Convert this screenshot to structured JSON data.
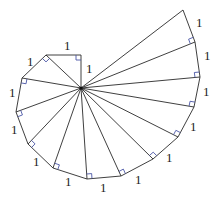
{
  "diagram": {
    "center": [
      81,
      88
    ],
    "vertices": [
      [
        81,
        55
      ],
      [
        46,
        55
      ],
      [
        22,
        78
      ],
      [
        16,
        112
      ],
      [
        28,
        144
      ],
      [
        53,
        168
      ],
      [
        87,
        179
      ],
      [
        121,
        176
      ],
      [
        153,
        159
      ],
      [
        178,
        137
      ],
      [
        194,
        107
      ],
      [
        200,
        77
      ],
      [
        195,
        42
      ],
      [
        183,
        10
      ]
    ],
    "edge_labels": [
      {
        "text": "1",
        "x": 64,
        "y": 50
      },
      {
        "text": "1",
        "x": 86,
        "y": 73
      },
      {
        "text": "1",
        "x": 27,
        "y": 66
      },
      {
        "text": "1",
        "x": 9,
        "y": 97
      },
      {
        "text": "1",
        "x": 11,
        "y": 134
      },
      {
        "text": "1",
        "x": 33,
        "y": 166
      },
      {
        "text": "1",
        "x": 65,
        "y": 186
      },
      {
        "text": "1",
        "x": 100,
        "y": 192
      },
      {
        "text": "1",
        "x": 135,
        "y": 184
      },
      {
        "text": "1",
        "x": 166,
        "y": 162
      },
      {
        "text": "1",
        "x": 190,
        "y": 131
      },
      {
        "text": "1",
        "x": 203,
        "y": 96
      },
      {
        "text": "1",
        "x": 204,
        "y": 60
      },
      {
        "text": "1",
        "x": 196,
        "y": 27
      }
    ],
    "line_color": "#2a2a2a",
    "right_angle_color": "#4a56a6"
  }
}
